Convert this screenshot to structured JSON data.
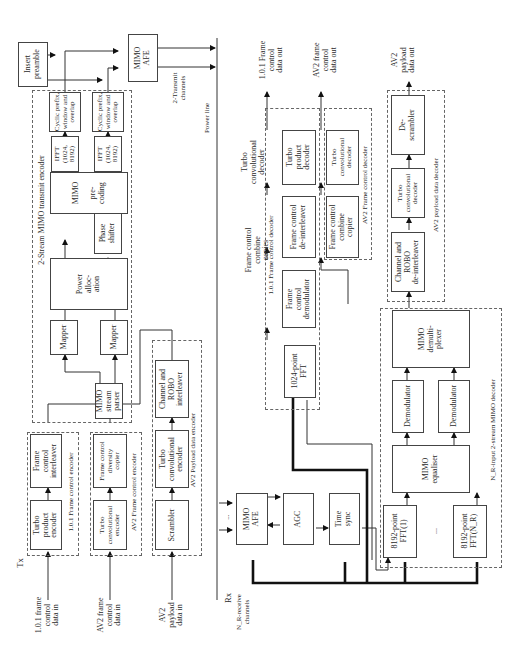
{
  "figure": {
    "orientation": "rotated 90 degrees counter-clockwise",
    "sections": {
      "tx": "Tx",
      "rx": "Rx",
      "medium": "Power line"
    },
    "tx": {
      "inputs": [
        {
          "id": "fc101_in",
          "label": "1.0.1 frame\ncontrol\ndata in"
        },
        {
          "id": "av2fc_in",
          "label": "AV2 frame\ncontrol\ndata in"
        },
        {
          "id": "av2pl_in",
          "label": "AV2\npayload\ndata in"
        }
      ],
      "groups": {
        "fc101_encoder": "1.0.1 Frame control encoder",
        "av2fc_encoder": "AV2 Frame control encoder",
        "av2pl_encoder": "AV2 Payload data encoder",
        "mimo_tx_encoder": "2-Stream MIMO transmit encoder"
      },
      "blocks": {
        "turbo_product_encoder": "Turbo\nproduct\nencoder",
        "fc_interleaver": "Frame\ncontrol\ninterleaver",
        "turbo_conv_encoder_fc": "Turbo\nconvolutional\nencoder",
        "fc_diversity_copier": "Frame control\ndiversity\ncopier",
        "scrambler": "Scrambler",
        "turbo_conv_encoder_pl": "Turbo\nconvolutional\nencoder",
        "channel_robo_interleaver": "Channel and\nROBO\ninterleaver",
        "stream_parser": "MIMO\nstream\nparser",
        "mapper_1": "Mapper",
        "mapper_2": "Mapper",
        "power_allocation": "Power\nalloc-\nation",
        "phase_shifter": "Phase\nshifter",
        "mimo_precoding": "MIMO\n\npre-\ncoding",
        "ifft_1": "IFFT\n(1024,\n8192)",
        "ifft_2": "IFFT\n(1024,\n8192)",
        "cp_window_1": "Cyclic prefix,\nwindow and\noverlap",
        "cp_window_2": "Cyclic prefix,\nwindow and\noverlap",
        "insert_preamble": "Insert\npreamble",
        "mimo_afe_tx": "MIMO\nAFE"
      },
      "channels_label": "2-Transmit\nchannels"
    },
    "rx": {
      "channels_label": "N_R-receive\nchannels",
      "ellipsis": "...",
      "blocks": {
        "mimo_afe_rx": "MIMO\nAFE",
        "agc": "AGC",
        "time_sync": "Time\nsync",
        "fft_1024": "1024-point\nFFT",
        "fc_demodulator": "Frame\ncontrol\ndemodulator",
        "fc_deinterleaver": "Frame control\nde-interleaver",
        "turbo_product_decoder": "Turbo\nproduct\ndecoder",
        "fc_combine_copier": "Frame control\ncombine\ncopier",
        "turbo_conv_decoder_fc": "Turbo\nconvolutional\ndecoder",
        "fft_8192_1": "8192-point\nFFT(1)",
        "fft_8192_n": "8192-point\nFFT(N_R)",
        "mimo_equaliser": "MIMO\nequaliser",
        "demodulator_1": "Demodulator",
        "demodulator_2": "Demodulator",
        "mimo_demultiplexer": "MIMO\ndemulti-\nplexer",
        "channel_robo_deinterleaver": "Channel and\nROBO\nde-interleaver",
        "turbo_conv_decoder_pl": "Turbo\nconvolutional\ndecoder",
        "descrambler": "De-\nscrambler"
      },
      "groups": {
        "fc101_decoder": "1.0.1 Frame control decoder",
        "av2fc_decoder": "AV2 Frame control decoder",
        "av2pl_decoder": "AV2 payload data decoder",
        "mimo_rx_decoder": "N_R-input 2-stream MIMO decoder"
      },
      "annotations": {
        "fc_combine_copies": "Frame control\ncombine\ncopies",
        "turbo_conv_decoder": "Turbo\nconvolutional\ndecoder"
      },
      "outputs": [
        {
          "id": "fc101_out",
          "label": "1.0.1 Frame\ncontrol\ndata out"
        },
        {
          "id": "av2fc_out",
          "label": "AV2 frame\ncontrol\ndata out"
        },
        {
          "id": "av2pl_out",
          "label": "AV2\npayload\ndata out"
        }
      ]
    }
  }
}
